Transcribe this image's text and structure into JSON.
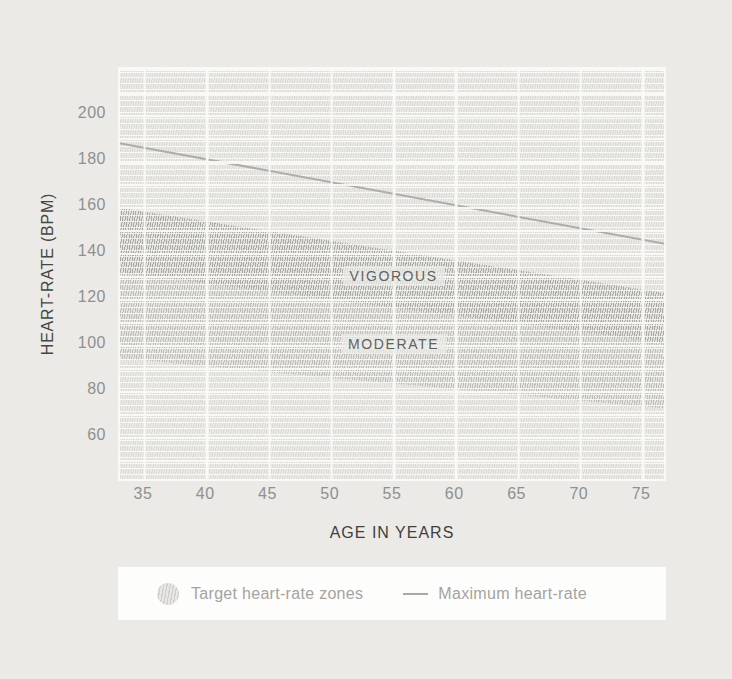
{
  "page": {
    "background": "#ebeae7"
  },
  "chart": {
    "y_axis_title": "HEART-RATE (BPM)",
    "x_axis_title": "AGE IN YEARS"
  },
  "legend": {
    "target_zones_label": "Target heart-rate zones",
    "max_heart_rate_label": "Maximum heart-rate"
  },
  "chart_data": {
    "type": "area",
    "title": "",
    "xlabel": "AGE IN YEARS",
    "ylabel": "HEART-RATE (BPM)",
    "x_range": [
      33,
      77
    ],
    "y_range": [
      40,
      220
    ],
    "x_ticks": [
      35,
      40,
      45,
      50,
      55,
      60,
      65,
      70,
      75
    ],
    "y_ticks": [
      200,
      180,
      160,
      140,
      120,
      100,
      80,
      60
    ],
    "grid": true,
    "legend_position": "bottom",
    "hatch_fill": true,
    "colors": {
      "max_line": "#aeadab",
      "vigorous_band": "#d4d3d1",
      "moderate_band": "#dfdedb",
      "background": "#eae9e6"
    },
    "series": [
      {
        "name": "Maximum heart-rate",
        "type": "line",
        "rule": "220 minus age",
        "points": [
          [
            33,
            187
          ],
          [
            77,
            143
          ]
        ],
        "color": "#aeadab"
      },
      {
        "name": "Vigorous target heart-rate zone",
        "type": "band",
        "label": "VIGOROUS",
        "percent_of_max": [
          70,
          85
        ],
        "upper_points": [
          [
            33,
            158.9
          ],
          [
            77,
            121.6
          ]
        ],
        "lower_points": [
          [
            33,
            130.9
          ],
          [
            77,
            100.1
          ]
        ]
      },
      {
        "name": "Moderate target heart-rate zone",
        "type": "band",
        "label": "MODERATE",
        "percent_of_max": [
          50,
          70
        ],
        "upper_points": [
          [
            33,
            130.9
          ],
          [
            77,
            100.1
          ]
        ],
        "lower_points": [
          [
            33,
            93.5
          ],
          [
            77,
            71.5
          ]
        ]
      }
    ]
  }
}
